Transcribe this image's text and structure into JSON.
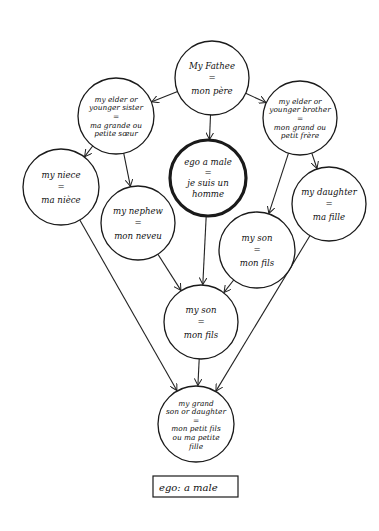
{
  "diagram": {
    "colors": {
      "ink": "#111111",
      "background": "#ffffff"
    },
    "nodes": [
      {
        "id": "father",
        "cx": 212,
        "cy": 78,
        "r": 37,
        "emphasis": false,
        "lines": [
          "My Fathee",
          "=",
          "mon père"
        ]
      },
      {
        "id": "sister",
        "cx": 116,
        "cy": 116,
        "r": 38,
        "emphasis": false,
        "lines": [
          "my elder or",
          "younger sister",
          "=",
          "ma grande ou",
          "petite sœur"
        ]
      },
      {
        "id": "brother",
        "cx": 300,
        "cy": 118,
        "r": 37,
        "emphasis": false,
        "lines": [
          "my elder or",
          "younger brother",
          "=",
          "mon grand ou",
          "petit frère"
        ]
      },
      {
        "id": "ego",
        "cx": 208,
        "cy": 178,
        "r": 38,
        "emphasis": true,
        "lines": [
          "ego a male",
          "=",
          "je suis un",
          "homme"
        ]
      },
      {
        "id": "niece",
        "cx": 61,
        "cy": 187,
        "r": 38,
        "emphasis": false,
        "lines": [
          "my niece",
          "=",
          "ma nièce"
        ]
      },
      {
        "id": "nephew",
        "cx": 138,
        "cy": 223,
        "r": 37,
        "emphasis": false,
        "lines": [
          "my nephew",
          "=",
          "mon neveu"
        ]
      },
      {
        "id": "daughter",
        "cx": 329,
        "cy": 204,
        "r": 37,
        "emphasis": false,
        "lines": [
          "my daughter",
          "=",
          "ma fille"
        ]
      },
      {
        "id": "son_right",
        "cx": 257,
        "cy": 250,
        "r": 38,
        "emphasis": false,
        "lines": [
          "my son",
          "=",
          "mon fils"
        ]
      },
      {
        "id": "son_center",
        "cx": 201,
        "cy": 322,
        "r": 37,
        "emphasis": false,
        "lines": [
          "my son",
          "=",
          "mon fils"
        ]
      },
      {
        "id": "grandchild",
        "cx": 196,
        "cy": 424,
        "r": 38,
        "emphasis": false,
        "lines": [
          "my grand",
          "son or daughter",
          "=",
          "mon petit fils",
          "ou ma petite",
          "fille"
        ]
      }
    ],
    "edges": [
      {
        "from": "father",
        "to": "sister"
      },
      {
        "from": "father",
        "to": "ego"
      },
      {
        "from": "father",
        "to": "brother"
      },
      {
        "from": "sister",
        "to": "niece"
      },
      {
        "from": "sister",
        "to": "nephew"
      },
      {
        "from": "brother",
        "to": "son_right"
      },
      {
        "from": "brother",
        "to": "daughter"
      },
      {
        "from": "ego",
        "to": "son_center"
      },
      {
        "from": "nephew",
        "to": "son_center"
      },
      {
        "from": "son_right",
        "to": "son_center"
      },
      {
        "from": "niece",
        "to": "grandchild"
      },
      {
        "from": "son_center",
        "to": "grandchild"
      },
      {
        "from": "daughter",
        "to": "grandchild"
      }
    ],
    "legend": {
      "label": "ego: a male",
      "x": 153,
      "y": 476,
      "w": 85,
      "h": 21
    }
  }
}
